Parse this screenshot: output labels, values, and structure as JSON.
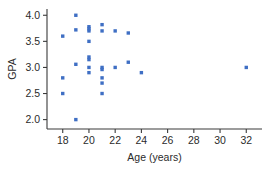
{
  "chart_data": {
    "type": "scatter",
    "title": "",
    "xlabel": "Age (years)",
    "ylabel": "GPA",
    "xlim": [
      16.8,
      33.2
    ],
    "ylim": [
      1.82,
      4.12
    ],
    "xticks": [
      18,
      20,
      22,
      24,
      26,
      28,
      30,
      32
    ],
    "yticks": [
      2.0,
      2.5,
      3.0,
      3.5,
      4.0
    ],
    "xticklabels": [
      "18",
      "20",
      "22",
      "24",
      "26",
      "28",
      "30",
      "32"
    ],
    "yticklabels": [
      "2.0",
      "2.5",
      "3.0",
      "3.5",
      "4.0"
    ],
    "grid": false,
    "legend": null,
    "marker_color": "#3f6fc4",
    "marker_shape": "square",
    "series": [
      {
        "name": "Students",
        "points": [
          [
            18,
            3.6
          ],
          [
            18,
            2.8
          ],
          [
            18,
            2.5
          ],
          [
            19,
            4.0
          ],
          [
            19,
            3.72
          ],
          [
            19,
            3.06
          ],
          [
            19,
            2.0
          ],
          [
            20,
            3.78
          ],
          [
            20,
            3.74
          ],
          [
            20,
            3.7
          ],
          [
            20,
            3.5
          ],
          [
            20,
            3.2
          ],
          [
            20,
            3.15
          ],
          [
            20,
            3.0
          ],
          [
            20,
            2.9
          ],
          [
            21,
            3.82
          ],
          [
            21,
            3.7
          ],
          [
            21,
            3.0
          ],
          [
            21,
            2.96
          ],
          [
            21,
            2.8
          ],
          [
            21,
            2.7
          ],
          [
            21,
            2.5
          ],
          [
            22,
            3.7
          ],
          [
            22,
            3.0
          ],
          [
            23,
            3.66
          ],
          [
            23,
            3.1
          ],
          [
            24,
            2.9
          ],
          [
            32,
            3.0
          ]
        ]
      }
    ]
  }
}
